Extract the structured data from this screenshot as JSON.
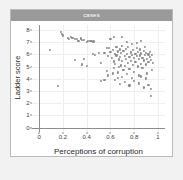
{
  "panel": {
    "title": "cases"
  },
  "colors": {
    "background": "#f2f2f2",
    "panel": "#ffffff",
    "panel_border": "#b9b9b9",
    "title_bar": "#9a9a9a",
    "title_text": "#ffffff",
    "axis_line": "#8d8d8d",
    "gridline": "#eeeeee",
    "point": "#8b8b8b",
    "tick_text": "#3a3a3a",
    "axis_title": "#2a2a2a"
  },
  "chart_data": {
    "type": "scatter",
    "title": "cases",
    "xlabel": "Perceptions of corruption",
    "ylabel": "Ladder score",
    "xlim": [
      -0.06,
      1.06
    ],
    "ylim": [
      -0.35,
      8.4
    ],
    "xticks": [
      0,
      0.2,
      0.4,
      0.6,
      0.8,
      1
    ],
    "xtick_labels": [
      "0",
      "0.2",
      "0.4",
      "0.6",
      "0.8",
      "1"
    ],
    "yticks": [
      0,
      1,
      2,
      3,
      4,
      5,
      6,
      7,
      8
    ],
    "ytick_labels": [
      "0",
      "1",
      "2",
      "3",
      "4",
      "5",
      "6",
      "7",
      "8"
    ],
    "grid": true,
    "legend": null,
    "marker": "circle",
    "marker_color": "#8b8b8b",
    "points": [
      [
        0.18,
        7.82
      ],
      [
        0.19,
        7.64
      ],
      [
        0.2,
        7.55
      ],
      [
        0.24,
        7.35
      ],
      [
        0.25,
        7.28
      ],
      [
        0.27,
        7.4
      ],
      [
        0.28,
        7.33
      ],
      [
        0.3,
        7.29
      ],
      [
        0.32,
        7.24
      ],
      [
        0.33,
        7.12
      ],
      [
        0.35,
        7.3
      ],
      [
        0.36,
        7.16
      ],
      [
        0.38,
        7.18
      ],
      [
        0.4,
        7.05
      ],
      [
        0.41,
        7.12
      ],
      [
        0.43,
        7.08
      ],
      [
        0.44,
        7.1
      ],
      [
        0.45,
        7.02
      ],
      [
        0.46,
        7.06
      ],
      [
        0.09,
        6.38
      ],
      [
        0.16,
        3.4
      ],
      [
        0.3,
        5.54
      ],
      [
        0.36,
        5.18
      ],
      [
        0.38,
        5.62
      ],
      [
        0.4,
        5.08
      ],
      [
        0.45,
        6.02
      ],
      [
        0.47,
        5.95
      ],
      [
        0.5,
        6.1
      ],
      [
        0.52,
        5.3
      ],
      [
        0.52,
        3.82
      ],
      [
        0.55,
        3.9
      ],
      [
        0.57,
        4.62
      ],
      [
        0.58,
        5.86
      ],
      [
        0.59,
        6.52
      ],
      [
        0.6,
        6.18
      ],
      [
        0.61,
        5.7
      ],
      [
        0.62,
        6.34
      ],
      [
        0.63,
        5.42
      ],
      [
        0.63,
        4.88
      ],
      [
        0.64,
        6.06
      ],
      [
        0.64,
        5.22
      ],
      [
        0.65,
        6.6
      ],
      [
        0.65,
        5.92
      ],
      [
        0.66,
        4.52
      ],
      [
        0.66,
        6.24
      ],
      [
        0.67,
        5.58
      ],
      [
        0.67,
        4.96
      ],
      [
        0.68,
        6.4
      ],
      [
        0.68,
        5.76
      ],
      [
        0.69,
        5.1
      ],
      [
        0.69,
        6.12
      ],
      [
        0.7,
        7.42
      ],
      [
        0.7,
        6.7
      ],
      [
        0.7,
        5.48
      ],
      [
        0.71,
        4.7
      ],
      [
        0.71,
        6.28
      ],
      [
        0.72,
        5.88
      ],
      [
        0.72,
        5.04
      ],
      [
        0.73,
        6.46
      ],
      [
        0.73,
        5.64
      ],
      [
        0.74,
        4.4
      ],
      [
        0.74,
        6.02
      ],
      [
        0.75,
        5.3
      ],
      [
        0.75,
        6.58
      ],
      [
        0.76,
        5.82
      ],
      [
        0.76,
        4.82
      ],
      [
        0.77,
        6.16
      ],
      [
        0.77,
        5.46
      ],
      [
        0.78,
        6.88
      ],
      [
        0.78,
        5.98
      ],
      [
        0.79,
        5.14
      ],
      [
        0.79,
        6.34
      ],
      [
        0.8,
        5.7
      ],
      [
        0.8,
        4.58
      ],
      [
        0.81,
        6.06
      ],
      [
        0.81,
        5.36
      ],
      [
        0.82,
        6.52
      ],
      [
        0.82,
        5.86
      ],
      [
        0.83,
        5.02
      ],
      [
        0.83,
        6.2
      ],
      [
        0.84,
        5.6
      ],
      [
        0.84,
        4.28
      ],
      [
        0.85,
        6.4
      ],
      [
        0.85,
        5.92
      ],
      [
        0.86,
        5.24
      ],
      [
        0.86,
        6.08
      ],
      [
        0.87,
        5.72
      ],
      [
        0.87,
        4.9
      ],
      [
        0.88,
        6.3
      ],
      [
        0.88,
        5.5
      ],
      [
        0.89,
        6.64
      ],
      [
        0.89,
        5.96
      ],
      [
        0.9,
        5.18
      ],
      [
        0.9,
        6.12
      ],
      [
        0.91,
        5.64
      ],
      [
        0.91,
        4.44
      ],
      [
        0.92,
        6.0
      ],
      [
        0.92,
        5.38
      ],
      [
        0.93,
        5.8
      ],
      [
        0.93,
        6.22
      ],
      [
        0.94,
        5.56
      ],
      [
        0.94,
        2.62
      ],
      [
        0.95,
        5.94
      ],
      [
        0.95,
        4.7
      ],
      [
        0.96,
        5.3
      ],
      [
        0.6,
        7.26
      ],
      [
        0.63,
        7.44
      ],
      [
        0.74,
        7.04
      ],
      [
        0.82,
        6.94
      ],
      [
        0.86,
        7.1
      ],
      [
        0.57,
        6.56
      ],
      [
        0.55,
        6.1
      ],
      [
        0.64,
        3.92
      ],
      [
        0.68,
        3.58
      ],
      [
        0.72,
        3.74
      ],
      [
        0.76,
        3.46
      ],
      [
        0.8,
        3.86
      ],
      [
        0.84,
        3.62
      ],
      [
        0.88,
        3.3
      ],
      [
        0.92,
        3.52
      ],
      [
        0.7,
        4.14
      ],
      [
        0.78,
        4.06
      ],
      [
        0.86,
        4.2
      ],
      [
        0.94,
        3.18
      ],
      [
        0.58,
        4.28
      ],
      [
        0.62,
        4.44
      ],
      [
        0.66,
        4.1
      ],
      [
        0.9,
        4.04
      ]
    ]
  }
}
